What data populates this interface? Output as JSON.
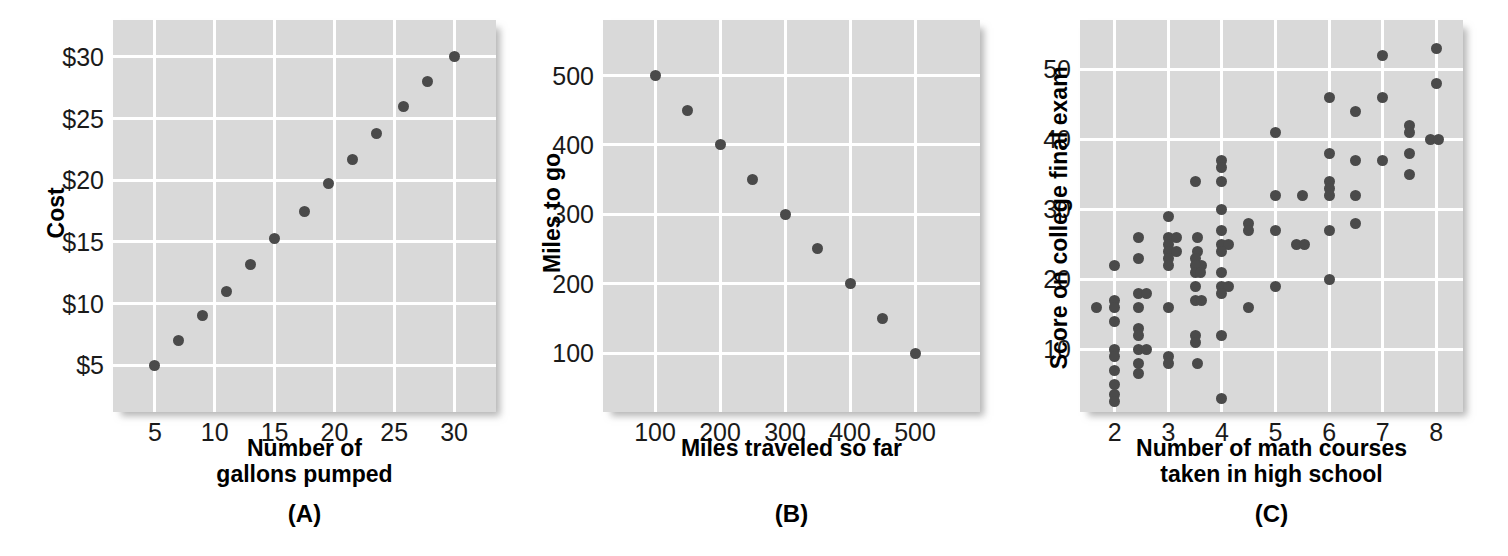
{
  "figure": {
    "background": "#ffffff",
    "plot_bg": "#d9d9d9",
    "grid_color": "#ffffff",
    "dot_color": "#4a4a4a",
    "text_color": "#1a1a1a"
  },
  "panels": [
    {
      "id": "A",
      "label": "(A)",
      "chart_data": {
        "type": "scatter",
        "title": "",
        "xlabel": "Number of\ngallons pumped",
        "ylabel": "Cost",
        "xticks": [
          5,
          10,
          15,
          20,
          25,
          30
        ],
        "xticklabels": [
          "5",
          "10",
          "15",
          "20",
          "25",
          "30"
        ],
        "yticks": [
          5,
          10,
          15,
          20,
          25,
          30
        ],
        "yticklabels": [
          "$5",
          "$10",
          "$15",
          "$20",
          "$25",
          "$30"
        ],
        "xlim": [
          1.5,
          33.5
        ],
        "ylim": [
          1.2,
          33.0
        ],
        "grid": true,
        "legend": "none",
        "points": [
          {
            "x": 5,
            "y": 5
          },
          {
            "x": 7,
            "y": 7
          },
          {
            "x": 9,
            "y": 9
          },
          {
            "x": 11,
            "y": 11
          },
          {
            "x": 13,
            "y": 13.2
          },
          {
            "x": 15,
            "y": 15.3
          },
          {
            "x": 17.5,
            "y": 17.5
          },
          {
            "x": 19.5,
            "y": 19.7
          },
          {
            "x": 21.5,
            "y": 21.7
          },
          {
            "x": 23.5,
            "y": 23.8
          },
          {
            "x": 25.8,
            "y": 26
          },
          {
            "x": 27.8,
            "y": 28
          },
          {
            "x": 30,
            "y": 30
          }
        ]
      }
    },
    {
      "id": "B",
      "label": "(B)",
      "chart_data": {
        "type": "scatter",
        "title": "",
        "xlabel": "Miles traveled so far",
        "ylabel": "Miles to go",
        "xticks": [
          100,
          200,
          300,
          400,
          500
        ],
        "xticklabels": [
          "100",
          "200",
          "300",
          "400",
          "500"
        ],
        "yticks": [
          100,
          200,
          300,
          400,
          500
        ],
        "yticklabels": [
          "100",
          "200",
          "300",
          "400",
          "500"
        ],
        "xlim": [
          20,
          600
        ],
        "ylim": [
          15,
          580
        ],
        "grid": true,
        "legend": "none",
        "points": [
          {
            "x": 100,
            "y": 500
          },
          {
            "x": 150,
            "y": 450
          },
          {
            "x": 200,
            "y": 400
          },
          {
            "x": 250,
            "y": 350
          },
          {
            "x": 300,
            "y": 300
          },
          {
            "x": 350,
            "y": 250
          },
          {
            "x": 400,
            "y": 200
          },
          {
            "x": 450,
            "y": 150
          },
          {
            "x": 500,
            "y": 100
          }
        ]
      }
    },
    {
      "id": "C",
      "label": "(C)",
      "chart_data": {
        "type": "scatter",
        "title": "",
        "xlabel": "Number of math courses\ntaken in high school",
        "ylabel": "Score on college final exam",
        "xticks": [
          2,
          3,
          4,
          5,
          6,
          7,
          8
        ],
        "xticklabels": [
          "2",
          "3",
          "4",
          "5",
          "6",
          "7",
          "8"
        ],
        "yticks": [
          10,
          20,
          30,
          40,
          50
        ],
        "yticklabels": [
          "10",
          "20",
          "30",
          "40",
          "50"
        ],
        "xlim": [
          1.35,
          8.5
        ],
        "ylim": [
          1.0,
          57.0
        ],
        "grid": true,
        "legend": "none",
        "points": [
          {
            "x": 1.65,
            "y": 16
          },
          {
            "x": 2.0,
            "y": 22
          },
          {
            "x": 2.0,
            "y": 17
          },
          {
            "x": 2.0,
            "y": 16
          },
          {
            "x": 2.0,
            "y": 14
          },
          {
            "x": 2.0,
            "y": 10
          },
          {
            "x": 2.0,
            "y": 9
          },
          {
            "x": 2.0,
            "y": 7
          },
          {
            "x": 2.0,
            "y": 5
          },
          {
            "x": 2.0,
            "y": 3.5
          },
          {
            "x": 2.0,
            "y": 2.5
          },
          {
            "x": 2.45,
            "y": 26
          },
          {
            "x": 2.45,
            "y": 23
          },
          {
            "x": 2.45,
            "y": 18
          },
          {
            "x": 2.45,
            "y": 16
          },
          {
            "x": 2.6,
            "y": 18
          },
          {
            "x": 2.45,
            "y": 13
          },
          {
            "x": 2.45,
            "y": 12
          },
          {
            "x": 2.45,
            "y": 10
          },
          {
            "x": 2.6,
            "y": 10
          },
          {
            "x": 2.45,
            "y": 8
          },
          {
            "x": 2.45,
            "y": 6.5
          },
          {
            "x": 3.0,
            "y": 29
          },
          {
            "x": 3.0,
            "y": 26
          },
          {
            "x": 3.0,
            "y": 25
          },
          {
            "x": 3.15,
            "y": 26
          },
          {
            "x": 3.0,
            "y": 24
          },
          {
            "x": 3.15,
            "y": 24
          },
          {
            "x": 3.0,
            "y": 23
          },
          {
            "x": 3.0,
            "y": 22
          },
          {
            "x": 3.0,
            "y": 16
          },
          {
            "x": 3.0,
            "y": 9
          },
          {
            "x": 3.0,
            "y": 8
          },
          {
            "x": 3.5,
            "y": 34
          },
          {
            "x": 3.55,
            "y": 26
          },
          {
            "x": 3.55,
            "y": 24
          },
          {
            "x": 3.5,
            "y": 23
          },
          {
            "x": 3.62,
            "y": 22
          },
          {
            "x": 3.5,
            "y": 22
          },
          {
            "x": 3.5,
            "y": 21
          },
          {
            "x": 3.6,
            "y": 21
          },
          {
            "x": 3.5,
            "y": 19
          },
          {
            "x": 3.5,
            "y": 17
          },
          {
            "x": 3.62,
            "y": 17
          },
          {
            "x": 3.5,
            "y": 12
          },
          {
            "x": 3.5,
            "y": 11
          },
          {
            "x": 3.55,
            "y": 8
          },
          {
            "x": 4.0,
            "y": 37
          },
          {
            "x": 4.0,
            "y": 36
          },
          {
            "x": 4.0,
            "y": 34
          },
          {
            "x": 4.0,
            "y": 30
          },
          {
            "x": 4.0,
            "y": 27
          },
          {
            "x": 4.0,
            "y": 25
          },
          {
            "x": 4.12,
            "y": 25
          },
          {
            "x": 4.0,
            "y": 24
          },
          {
            "x": 4.0,
            "y": 21
          },
          {
            "x": 4.0,
            "y": 19
          },
          {
            "x": 4.12,
            "y": 19
          },
          {
            "x": 4.0,
            "y": 18
          },
          {
            "x": 4.0,
            "y": 12
          },
          {
            "x": 4.0,
            "y": 3
          },
          {
            "x": 4.5,
            "y": 28
          },
          {
            "x": 4.5,
            "y": 27
          },
          {
            "x": 4.5,
            "y": 16
          },
          {
            "x": 5.0,
            "y": 41
          },
          {
            "x": 5.0,
            "y": 32
          },
          {
            "x": 5.0,
            "y": 27
          },
          {
            "x": 5.0,
            "y": 19
          },
          {
            "x": 5.5,
            "y": 32
          },
          {
            "x": 5.4,
            "y": 25
          },
          {
            "x": 5.55,
            "y": 25
          },
          {
            "x": 6.0,
            "y": 46
          },
          {
            "x": 6.0,
            "y": 38
          },
          {
            "x": 6.0,
            "y": 34
          },
          {
            "x": 6.0,
            "y": 33
          },
          {
            "x": 6.0,
            "y": 32
          },
          {
            "x": 6.0,
            "y": 27
          },
          {
            "x": 6.0,
            "y": 20
          },
          {
            "x": 6.5,
            "y": 44
          },
          {
            "x": 6.5,
            "y": 37
          },
          {
            "x": 6.5,
            "y": 32
          },
          {
            "x": 6.5,
            "y": 28
          },
          {
            "x": 7.0,
            "y": 52
          },
          {
            "x": 7.0,
            "y": 46
          },
          {
            "x": 7.0,
            "y": 37
          },
          {
            "x": 7.5,
            "y": 42
          },
          {
            "x": 7.5,
            "y": 41
          },
          {
            "x": 7.5,
            "y": 38
          },
          {
            "x": 7.5,
            "y": 35
          },
          {
            "x": 8.0,
            "y": 53
          },
          {
            "x": 8.0,
            "y": 48
          },
          {
            "x": 7.9,
            "y": 40
          },
          {
            "x": 8.05,
            "y": 40
          }
        ]
      }
    }
  ]
}
